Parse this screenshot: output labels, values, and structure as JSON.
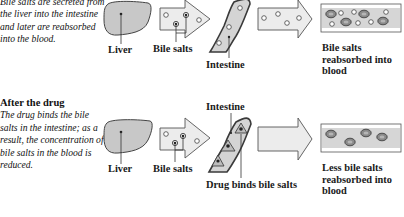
{
  "panels": [
    {
      "id": "before",
      "caption_title": "",
      "caption_text": "Bile salts are secreted from the liver into the intestine and later are reabsorbed into the blood.",
      "labels": {
        "liver": "Liver",
        "bile_salts": "Bile salts",
        "intestine": "Intestine",
        "result": "Bile salts reabsorbed into blood"
      }
    },
    {
      "id": "after",
      "caption_title": "After the drug",
      "caption_text": "The drug binds the bile salts in the intestine; as a result, the concentration of bile salts in the blood is reduced.",
      "labels": {
        "liver": "Liver",
        "bile_salts": "Bile salts",
        "intestine": "Intestine",
        "drug": "Drug binds bile salts",
        "result": "Less bile salts reabsorbed into blood"
      }
    }
  ],
  "colors": {
    "organ_fill": "#c8c8c8",
    "arrow_fill": "#ececec",
    "vessel_fill": "#d9d9d9",
    "outline": "#4a4a4a",
    "text": "#1a1a1a"
  }
}
